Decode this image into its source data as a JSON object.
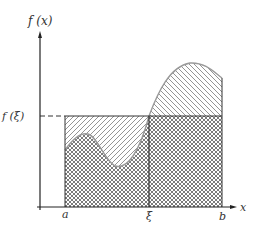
{
  "diagram": {
    "y_axis_label": "f (x)",
    "x_axis_label": "x",
    "level_label": "f (ξ)",
    "tick_labels": {
      "a": "a",
      "xi": "ξ",
      "b": "b"
    },
    "regions": [
      {
        "name": "area-under-curve",
        "pattern": "cross-hatch"
      },
      {
        "name": "rectangle-excess-above-curve",
        "pattern": "diagonal-hatch-forward"
      },
      {
        "name": "curve-excess-above-rectangle",
        "pattern": "diagonal-hatch-backward"
      }
    ],
    "colors": {
      "axis": "#222222",
      "curve": "#9a9a9a",
      "hatch": "#555555",
      "rect": "#333333"
    }
  }
}
